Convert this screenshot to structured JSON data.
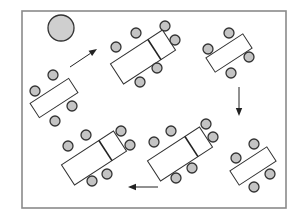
{
  "diagram": {
    "width": 303,
    "height": 216,
    "frame": {
      "x": 22,
      "y": 11,
      "w": 264,
      "h": 197,
      "color": "#8a8a8a"
    },
    "pillar": {
      "cx": 61,
      "cy": 28,
      "r": 13,
      "fill": "#cfcfcf"
    },
    "chair_fill": "#c4c4c4",
    "chair_radius": 5,
    "tables": [
      {
        "id": "left-table",
        "cx": 54,
        "cy": 98,
        "w": 46,
        "h": 17,
        "angle": -33,
        "divider": null,
        "chairs": [
          [
            53,
            75
          ],
          [
            35,
            91
          ],
          [
            72,
            106
          ],
          [
            55,
            121
          ]
        ]
      },
      {
        "id": "top-middle-table",
        "cx": 143,
        "cy": 57,
        "w": 62,
        "h": 24,
        "angle": -33,
        "divider": 0.28,
        "chairs": [
          [
            136,
            33
          ],
          [
            116,
            47
          ],
          [
            165,
            26
          ],
          [
            175,
            40
          ],
          [
            157,
            68
          ],
          [
            140,
            82
          ]
        ]
      },
      {
        "id": "top-right-table",
        "cx": 229,
        "cy": 53,
        "w": 44,
        "h": 17,
        "angle": -33,
        "divider": null,
        "chairs": [
          [
            229,
            33
          ],
          [
            208,
            49
          ],
          [
            249,
            57
          ],
          [
            231,
            73
          ]
        ]
      },
      {
        "id": "bottom-left-table",
        "cx": 94,
        "cy": 158,
        "w": 62,
        "h": 24,
        "angle": -33,
        "divider": 0.28,
        "chairs": [
          [
            86,
            135
          ],
          [
            68,
            146
          ],
          [
            121,
            131
          ],
          [
            130,
            145
          ],
          [
            107,
            174
          ],
          [
            92,
            181
          ]
        ]
      },
      {
        "id": "bottom-middle-table",
        "cx": 180,
        "cy": 154,
        "w": 62,
        "h": 24,
        "angle": -33,
        "divider": 0.28,
        "chairs": [
          [
            171,
            131
          ],
          [
            154,
            142
          ],
          [
            206,
            124
          ],
          [
            213,
            137
          ],
          [
            192,
            168
          ],
          [
            176,
            178
          ]
        ]
      },
      {
        "id": "bottom-right-table",
        "cx": 253,
        "cy": 166,
        "w": 44,
        "h": 17,
        "angle": -33,
        "divider": null,
        "chairs": [
          [
            254,
            144
          ],
          [
            236,
            158
          ],
          [
            270,
            174
          ],
          [
            254,
            187
          ]
        ]
      }
    ],
    "arrows": [
      {
        "id": "arrow-up-right",
        "x1": 70,
        "y1": 67,
        "x2": 97,
        "y2": 49
      },
      {
        "id": "arrow-down",
        "x1": 239,
        "y1": 87,
        "x2": 239,
        "y2": 116
      },
      {
        "id": "arrow-left",
        "x1": 158,
        "y1": 187,
        "x2": 128,
        "y2": 187
      }
    ]
  }
}
